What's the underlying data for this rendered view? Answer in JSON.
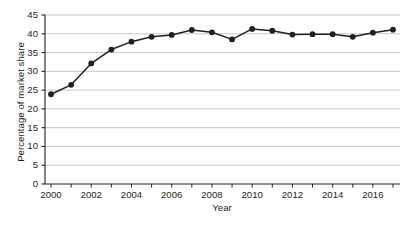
{
  "chart_data": {
    "type": "line",
    "title": "",
    "xlabel": "Year",
    "ylabel": "Percentage of market share",
    "x": [
      2000,
      2001,
      2002,
      2003,
      2004,
      2005,
      2006,
      2007,
      2008,
      2009,
      2010,
      2011,
      2012,
      2013,
      2014,
      2015,
      2016,
      2017
    ],
    "values": [
      23.9,
      26.4,
      32.1,
      35.8,
      37.9,
      39.2,
      39.7,
      41.0,
      40.4,
      38.5,
      41.3,
      40.8,
      39.8,
      39.9,
      39.9,
      39.2,
      40.3,
      41.1
    ],
    "series": [
      {
        "name": "Percentage of market share",
        "values": [
          23.9,
          26.4,
          32.1,
          35.8,
          37.9,
          39.2,
          39.7,
          41.0,
          40.4,
          38.5,
          41.3,
          40.8,
          39.8,
          39.9,
          39.9,
          39.2,
          40.3,
          41.1
        ]
      }
    ],
    "ylim": [
      0,
      45
    ],
    "xlim": [
      1999.5,
      2017.6
    ],
    "ytick_labels": [
      "0",
      "5",
      "10",
      "15",
      "20",
      "25",
      "30",
      "35",
      "40",
      "45"
    ],
    "ytick_values": [
      0,
      5,
      10,
      15,
      20,
      25,
      30,
      35,
      40,
      45
    ],
    "xtick_labels": [
      "2000",
      "2002",
      "2004",
      "2006",
      "2008",
      "2010",
      "2012",
      "2014",
      "2016"
    ],
    "xtick_values": [
      2000,
      2002,
      2004,
      2006,
      2008,
      2010,
      2012,
      2014,
      2016
    ],
    "xminor_values": [
      2000,
      2001,
      2002,
      2003,
      2004,
      2005,
      2006,
      2007,
      2008,
      2009,
      2010,
      2011,
      2012,
      2013,
      2014,
      2015,
      2016,
      2017
    ],
    "grid": "horizontal",
    "legend": "none",
    "marker": "filled-circle",
    "line_color": "#231f20",
    "marker_color": "#231f20",
    "grid_color": "#b9bbbd",
    "axis_color": "#231f20",
    "background_color": "#ffffff"
  }
}
